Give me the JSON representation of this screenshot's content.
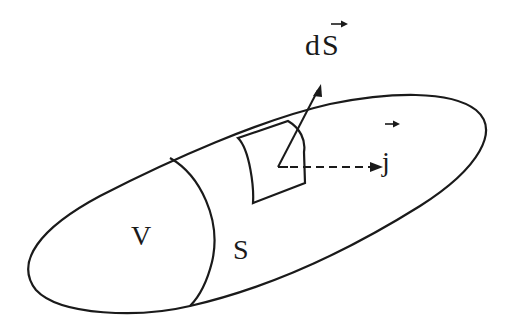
{
  "diagram": {
    "labels": {
      "surface_element": "dS",
      "current_density": "j",
      "volume": "V",
      "surface": "S"
    },
    "vector_marks": {
      "surface_element_arrow": "→",
      "current_density_arrow": "→"
    },
    "colors": {
      "stroke": "#1a1a1a",
      "background": "#ffffff"
    }
  }
}
